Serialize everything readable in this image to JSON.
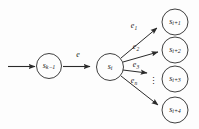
{
  "diagram": {
    "background_color": "#fdfdfd",
    "stroke_color": "#2a2a2a",
    "text_color": "#1b1b1b",
    "nodes": [
      {
        "id": "s_k_minus_1",
        "base": "s",
        "sub": "k−1",
        "cx": 49,
        "cy": 66,
        "r": 12.5
      },
      {
        "id": "s_i",
        "base": "s",
        "sub": "i",
        "cx": 110,
        "cy": 67,
        "r": 13.5
      },
      {
        "id": "s_i_plus_1",
        "base": "s",
        "sub": "i+1",
        "cx": 175,
        "cy": 22,
        "r": 13
      },
      {
        "id": "s_i_plus_2",
        "base": "s",
        "sub": "i+2",
        "cx": 175,
        "cy": 50,
        "r": 13
      },
      {
        "id": "s_i_plus_3",
        "base": "s",
        "sub": "i+3",
        "cx": 175,
        "cy": 79,
        "r": 13
      },
      {
        "id": "s_i_plus_4",
        "base": "s",
        "sub": "i+4",
        "cx": 175,
        "cy": 110,
        "r": 13
      }
    ],
    "edges": [
      {
        "id": "entry-arrow",
        "label_base": "",
        "label_sub": "",
        "from": "start",
        "to": "s_k_minus_1"
      },
      {
        "id": "edge-e",
        "label_base": "e",
        "label_sub": "",
        "from": "s_k_minus_1",
        "to": "s_i",
        "label_x": 78,
        "label_y": 56
      },
      {
        "id": "edge-e1",
        "label_base": "e",
        "label_sub": "1",
        "from": "s_i",
        "to": "s_i_plus_1",
        "label_x": 134,
        "label_y": 27
      },
      {
        "id": "edge-e2",
        "label_base": "e",
        "label_sub": "2",
        "from": "s_i",
        "to": "s_i_plus_2",
        "label_x": 136,
        "label_y": 48
      },
      {
        "id": "edge-e3",
        "label_base": "e",
        "label_sub": "3",
        "from": "s_i",
        "to": "s_i_plus_3",
        "label_x": 136,
        "label_y": 66
      },
      {
        "id": "edge-en",
        "label_base": "e",
        "label_sub": "n",
        "from": "s_i",
        "to": "s_i_plus_4",
        "label_x": 134,
        "label_y": 82
      }
    ],
    "ellipsis": {
      "glyph": "⋮",
      "x": 153,
      "y": 81
    }
  }
}
